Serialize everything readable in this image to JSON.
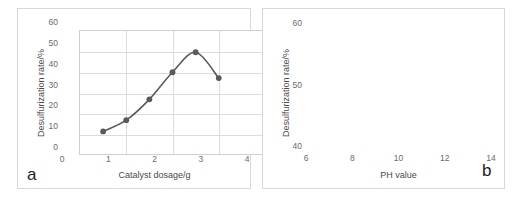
{
  "figure": {
    "background": "#ffffff",
    "series_color": "#5a5a5a",
    "grid_color": "#dcdcdc",
    "axis_color": "#cfcfcf"
  },
  "panels": [
    {
      "id": "a",
      "label": "a"
    },
    {
      "id": "b",
      "label": "b"
    }
  ],
  "chart_data": [
    {
      "type": "line",
      "panel": "a",
      "title": "",
      "xlabel": "Catalyst dosage/g",
      "ylabel": "Desulfurization rate/%",
      "xlim": [
        0,
        4
      ],
      "ylim": [
        0,
        60
      ],
      "xticks": [
        0,
        1,
        2,
        3,
        4
      ],
      "yticks": [
        0,
        10,
        20,
        30,
        40,
        50,
        60
      ],
      "xtick_labels": [
        "0",
        "1",
        "2",
        "3",
        "4"
      ],
      "ytick_labels": [
        "0",
        "10",
        "20",
        "30",
        "40",
        "50",
        "60"
      ],
      "grid": true,
      "legend": "none",
      "marker": "circle",
      "x": [
        0.5,
        1.0,
        1.5,
        2.0,
        2.5,
        3.0
      ],
      "values": [
        11.8,
        17.2,
        27.2,
        40.2,
        49.8,
        37.4
      ]
    },
    {
      "type": "line",
      "panel": "b",
      "title": "",
      "xlabel": "PH value",
      "ylabel": "Desulfurization rate/%",
      "xlim": [
        6,
        14
      ],
      "ylim": [
        40,
        60
      ],
      "xticks": [
        6,
        8,
        10,
        12,
        14
      ],
      "yticks": [
        40,
        50,
        60
      ],
      "xtick_labels": [
        "6",
        "8",
        "10",
        "12",
        "14"
      ],
      "ytick_labels": [
        "40",
        "50",
        "60"
      ],
      "grid": true,
      "legend": "none",
      "marker": "circle",
      "x": [
        7,
        8,
        10,
        12
      ],
      "values": [
        50.8,
        52.5,
        55.3,
        49.4
      ]
    }
  ]
}
